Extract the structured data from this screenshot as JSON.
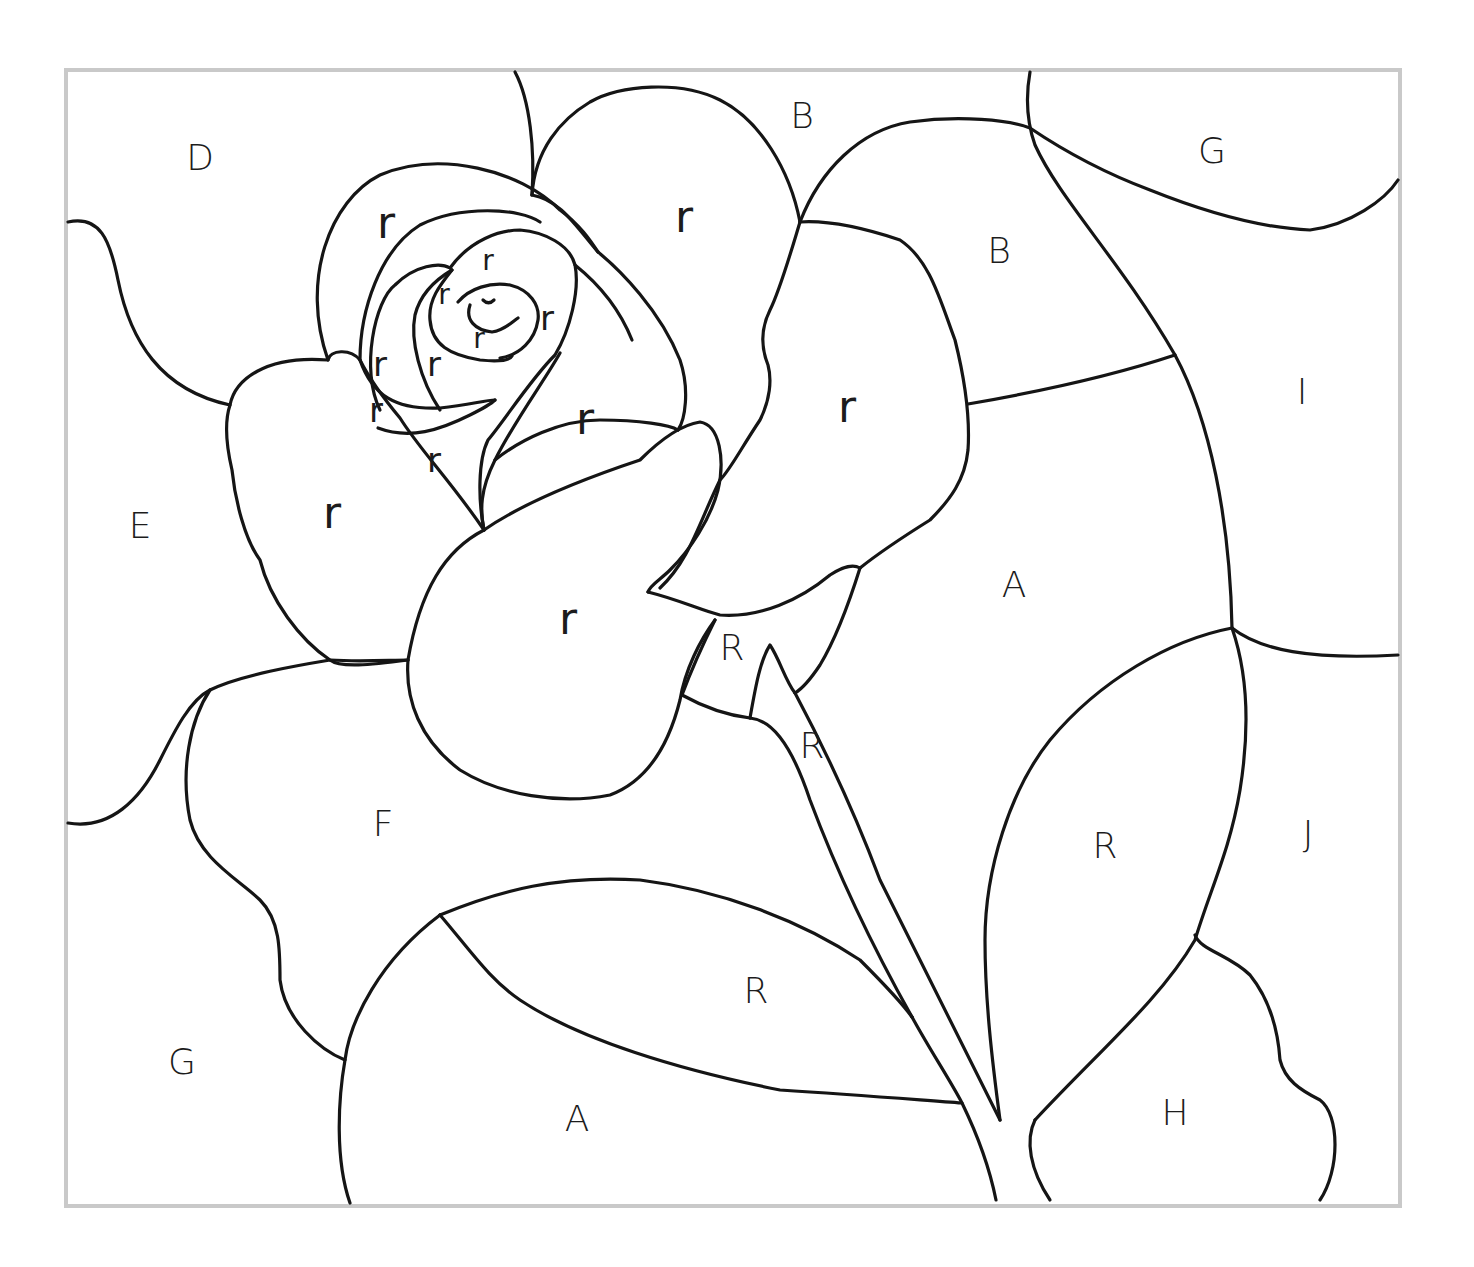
{
  "image": {
    "subject": "Rose color-by-letter coloring page",
    "frame_color": "#c9c9c9",
    "line_color": "#151515",
    "background": "#ffffff"
  },
  "labels": {
    "D": "D",
    "B_top": "B",
    "G_top": "G",
    "B_right": "B",
    "I": "I",
    "E": "E",
    "A_mid": "A",
    "F": "F",
    "J": "J",
    "R_leaf_right": "R",
    "R_sepal_left": "R",
    "R_sepal_stem": "R",
    "R_leaf_bottom": "R",
    "G_bottom": "G",
    "A_bottom": "A",
    "H": "H",
    "petal_r": [
      "r",
      "r",
      "r",
      "r",
      "r",
      "r",
      "r",
      "r",
      "r",
      "r",
      "r",
      "r",
      "r"
    ]
  }
}
